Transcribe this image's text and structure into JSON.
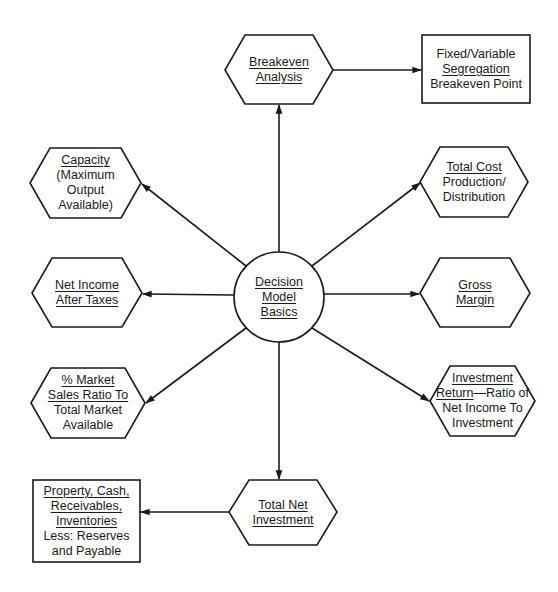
{
  "diagram": {
    "center": {
      "lines": [
        "Decision",
        "Model",
        "Basics"
      ],
      "underlined": [
        true,
        true,
        true
      ]
    },
    "nodes": {
      "breakeven": {
        "lines": [
          "Breakeven",
          "Analysis"
        ]
      },
      "fixed_variable": {
        "lines": [
          "Fixed/Variable",
          "Segregation",
          "Breakeven Point"
        ]
      },
      "capacity": {
        "lines": [
          "Capacity",
          "(Maximum",
          "Output",
          "Available)"
        ]
      },
      "total_cost": {
        "lines": [
          "Total Cost",
          "Production/",
          "Distribution"
        ]
      },
      "net_income": {
        "lines": [
          "Net Income",
          "After Taxes"
        ]
      },
      "gross_margin": {
        "lines": [
          "Gross",
          "Margin"
        ]
      },
      "market_share": {
        "lines": [
          "% Market",
          "Sales Ratio To",
          "Total Market",
          "Available"
        ]
      },
      "investment_return": {
        "lines": [
          "Investment",
          "Return",
          "—Ratio of",
          "Net Income To",
          "Investment"
        ]
      },
      "total_net_investment": {
        "lines": [
          "Total Net",
          "Investment"
        ]
      },
      "property": {
        "lines": [
          "Property, Cash,",
          "Receivables,",
          "Inventories",
          "Less: Reserves",
          "and Payable"
        ]
      }
    },
    "edges": [
      {
        "from": "center",
        "to": "breakeven"
      },
      {
        "from": "breakeven",
        "to": "fixed_variable"
      },
      {
        "from": "center",
        "to": "capacity"
      },
      {
        "from": "center",
        "to": "total_cost"
      },
      {
        "from": "center",
        "to": "net_income"
      },
      {
        "from": "center",
        "to": "gross_margin"
      },
      {
        "from": "center",
        "to": "market_share"
      },
      {
        "from": "center",
        "to": "investment_return"
      },
      {
        "from": "center",
        "to": "total_net_investment"
      },
      {
        "from": "total_net_investment",
        "to": "property"
      }
    ],
    "colors": {
      "stroke": "#1a1a1a",
      "background": "#ffffff"
    }
  }
}
